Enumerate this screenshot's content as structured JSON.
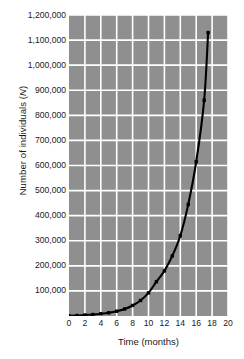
{
  "chart_data": {
    "type": "line",
    "title": "",
    "xlabel": "Time (months)",
    "ylabel": "Number of individuals (N)",
    "ylabel_prefix": "Number of individuals (",
    "ylabel_italic": "N",
    "ylabel_suffix": ")",
    "xlim": [
      0,
      20
    ],
    "ylim": [
      0,
      1200000
    ],
    "grid": true,
    "legend": false,
    "plot_background": "#8f8f8f",
    "gridline_color": "#ffffff",
    "line_color": "#000000",
    "marker_color": "#000000",
    "marker_shape": "square",
    "xticks": [
      0,
      2,
      4,
      6,
      8,
      10,
      12,
      14,
      16,
      18,
      20
    ],
    "xtick_labels": [
      "0",
      "2",
      "4",
      "6",
      "8",
      "10",
      "12",
      "14",
      "16",
      "18",
      "20"
    ],
    "yticks": [
      100000,
      200000,
      300000,
      400000,
      500000,
      600000,
      700000,
      800000,
      900000,
      1000000,
      1100000,
      1200000
    ],
    "ytick_labels": [
      "100,000",
      "200,000",
      "300,000",
      "400,000",
      "500,000",
      "600,000",
      "700,000",
      "800,000",
      "900,000",
      "1,000,000",
      "1,100,000",
      "1,200,000"
    ],
    "series": [
      {
        "name": "Population growth",
        "x": [
          0,
          1,
          2,
          3,
          4,
          5,
          6,
          7,
          8,
          9,
          10,
          11,
          12,
          13,
          14,
          15,
          16,
          17,
          17.5
        ],
        "values": [
          1000,
          2000,
          4000,
          6000,
          9000,
          13000,
          19000,
          28000,
          42000,
          62000,
          92000,
          137000,
          180000,
          240000,
          320000,
          445000,
          615000,
          860000,
          1130000
        ]
      }
    ]
  }
}
